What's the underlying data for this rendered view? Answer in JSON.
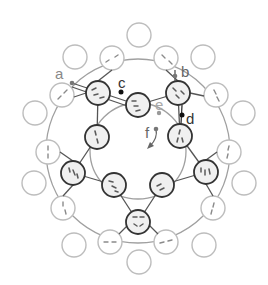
{
  "diagram": {
    "labels": [
      {
        "id": "a",
        "text": "a",
        "x": 55,
        "y": 79,
        "color": "#888888"
      },
      {
        "id": "b",
        "text": "b",
        "x": 181,
        "y": 77,
        "color": "#666666"
      },
      {
        "id": "c",
        "text": "c",
        "x": 120,
        "y": 88,
        "color": "#333333"
      },
      {
        "id": "d",
        "text": "d",
        "x": 187,
        "y": 124,
        "color": "#333333"
      },
      {
        "id": "e",
        "text": "e",
        "x": 156,
        "y": 110,
        "color": "#aaaaaa"
      },
      {
        "id": "f",
        "text": "f",
        "x": 144,
        "y": 138,
        "color": "#666666"
      }
    ],
    "points": [
      {
        "id": "a",
        "x": 72,
        "y": 83,
        "color": "#777777"
      },
      {
        "id": "b",
        "x": 175,
        "y": 76,
        "color": "#777777"
      },
      {
        "id": "c",
        "x": 121,
        "y": 92,
        "color": "#111111"
      },
      {
        "id": "d",
        "x": 182,
        "y": 115,
        "color": "#111111"
      },
      {
        "id": "e",
        "x": 159,
        "y": 113,
        "color": "#999999"
      },
      {
        "id": "f",
        "x": 156,
        "y": 129,
        "color": "#777777"
      }
    ],
    "colors": {
      "dark_stroke": "#333333",
      "dark_fill": "#efefef",
      "light_stroke": "#b8b8b8",
      "ring_stroke": "#9a9a9a",
      "dash_dark": "#555555",
      "dash_light": "#888888"
    }
  }
}
